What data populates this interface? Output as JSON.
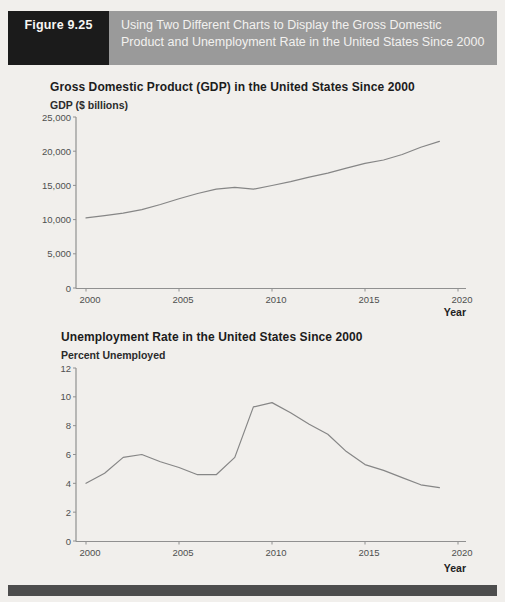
{
  "figure_header": {
    "label": "Figure 9.25",
    "caption": "Using Two Different Charts to Display the Gross Domestic Product and Unemployment Rate in the United States Since 2000"
  },
  "colors": {
    "paper": "#f1efec",
    "header_label_bg": "#1b1b1b",
    "header_caption_bg": "#9a9a9a",
    "header_text": "#f2f1ef",
    "axis": "#909090",
    "data_line": "#868686",
    "tick_label": "#4f4f4f",
    "title_text": "#1c1c1c",
    "footer_bar": "#4d4d4d"
  },
  "chart_data": [
    {
      "type": "line",
      "title": "Gross Domestic Product (GDP) in the United States Since 2000",
      "ylabel": "GDP ($ billions)",
      "xlabel": "Year",
      "x": [
        2000,
        2001,
        2002,
        2003,
        2004,
        2005,
        2006,
        2007,
        2008,
        2009,
        2010,
        2011,
        2012,
        2013,
        2014,
        2015,
        2016,
        2017,
        2018,
        2019
      ],
      "values": [
        10252,
        10582,
        10936,
        11458,
        12214,
        13037,
        13815,
        14452,
        14713,
        14449,
        14992,
        15543,
        16197,
        16785,
        17527,
        18225,
        18715,
        19519,
        20580,
        21433
      ],
      "xlim": [
        2000,
        2020
      ],
      "ylim": [
        0,
        25000
      ],
      "xticks": [
        2000,
        2005,
        2010,
        2015,
        2020
      ],
      "yticks": [
        0,
        5000,
        10000,
        15000,
        20000,
        25000
      ],
      "ytick_labels": [
        "0",
        "5,000",
        "10,000",
        "15,000",
        "20,000",
        "25,000"
      ],
      "grid": false,
      "legend": "none"
    },
    {
      "type": "line",
      "title": "Unemployment Rate in the United States Since 2000",
      "ylabel": "Percent Unemployed",
      "xlabel": "Year",
      "x": [
        2000,
        2001,
        2002,
        2003,
        2004,
        2005,
        2006,
        2007,
        2008,
        2009,
        2010,
        2011,
        2012,
        2013,
        2014,
        2015,
        2016,
        2017,
        2018,
        2019
      ],
      "values": [
        4.0,
        4.7,
        5.8,
        6.0,
        5.5,
        5.1,
        4.6,
        4.6,
        5.8,
        9.3,
        9.6,
        8.9,
        8.1,
        7.4,
        6.2,
        5.3,
        4.9,
        4.4,
        3.9,
        3.7
      ],
      "xlim": [
        2000,
        2020
      ],
      "ylim": [
        0,
        12
      ],
      "xticks": [
        2000,
        2005,
        2010,
        2015,
        2020
      ],
      "yticks": [
        0,
        2,
        4,
        6,
        8,
        10,
        12
      ],
      "ytick_labels": [
        "0",
        "2",
        "4",
        "6",
        "8",
        "10",
        "12"
      ],
      "grid": false,
      "legend": "none"
    }
  ]
}
